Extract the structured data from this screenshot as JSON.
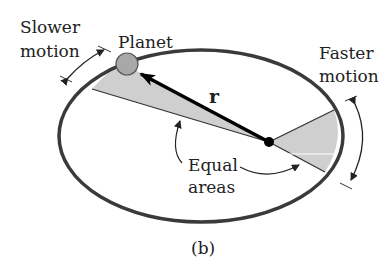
{
  "figure": {
    "caption": "(b)",
    "labels": {
      "slower_line1": "Slower",
      "slower_line2": "motion",
      "planet": "Planet",
      "radius": "r",
      "faster_line1": "Faster",
      "faster_line2": "motion",
      "equal_line1": "Equal",
      "equal_line2": "areas"
    },
    "colors": {
      "orbit": "#3a3a3a",
      "shaded_area": "#cfcfcf",
      "planet_fill": "#a8a8a8",
      "sun": "#000000",
      "text": "#222222"
    },
    "icons": [
      "planet-circle",
      "sun-dot",
      "radius-arrow",
      "motion-arrows",
      "pointer-arrows"
    ]
  }
}
